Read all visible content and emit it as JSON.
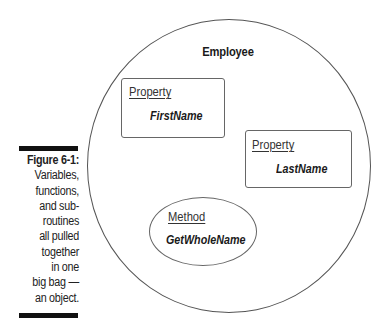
{
  "figure": {
    "caption": {
      "title": "Figure 6-1:",
      "lines": [
        "Variables,",
        "functions,",
        "and sub-",
        "routines",
        "all pulled",
        "together",
        "in one",
        "big bag —",
        "an object."
      ]
    },
    "diagram": {
      "object": {
        "label": "Employee",
        "shape": "circle"
      },
      "members": [
        {
          "kind": "Property",
          "name": "FirstName",
          "shape": "rounded-rectangle"
        },
        {
          "kind": "Property",
          "name": "LastName",
          "shape": "rounded-rectangle"
        },
        {
          "kind": "Method",
          "name": "GetWholeName",
          "shape": "ellipse"
        }
      ]
    },
    "colors": {
      "background": "#ffffff",
      "stroke": "#555555",
      "text": "#1a1a1a",
      "caption_bar": "#111111"
    }
  }
}
